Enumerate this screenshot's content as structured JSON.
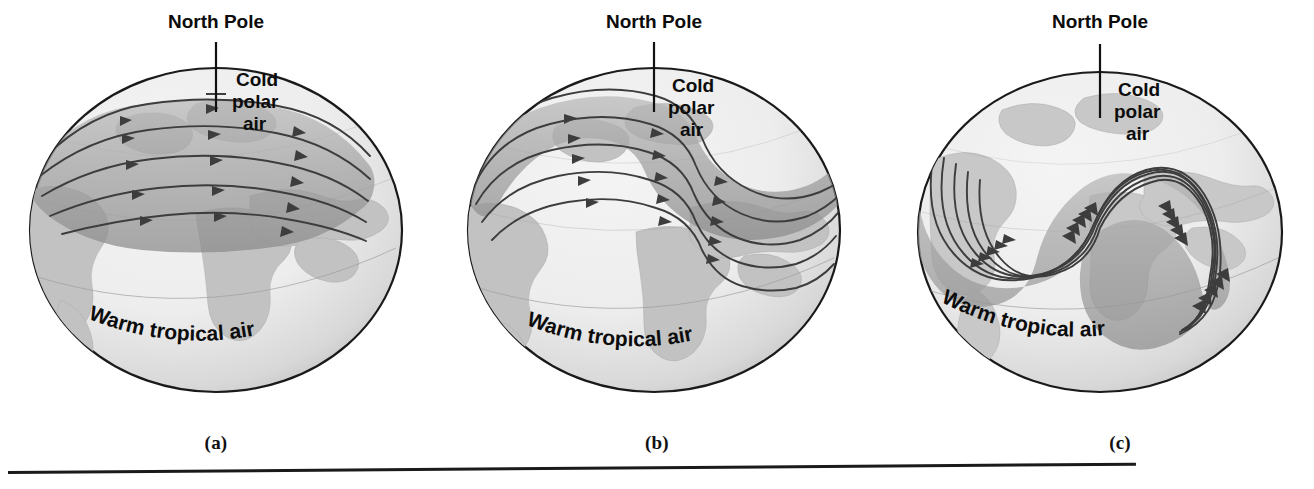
{
  "figure": {
    "panel_count": 3,
    "background_color": "#ffffff",
    "ink_color": "#111111",
    "globe_fill": "#ececec",
    "continent_fill": "#bdbdbd",
    "jet_band_fill": "#9a9a9a",
    "jet_line_color": "#3a3a3a"
  },
  "labels": {
    "north_pole": "North Pole",
    "cold_line1": "Cold",
    "cold_line2": "polar",
    "cold_line3": "air",
    "warm": "Warm tropical air"
  },
  "panels": [
    {
      "id": "a",
      "letter": "(a)",
      "stage_description": "Jet stream flows nearly west to east in a smooth ring around the pole",
      "wave_amplitude": "none",
      "flow_line_count": 5,
      "labels": {
        "north_pole": "North Pole",
        "cold_line1": "Cold",
        "cold_line2": "polar",
        "cold_line3": "air",
        "warm": "Warm tropical air"
      }
    },
    {
      "id": "b",
      "letter": "(b)",
      "stage_description": "A single large meander develops in the jet stream",
      "wave_amplitude": "moderate",
      "flow_line_count": 5,
      "labels": {
        "north_pole": "North Pole",
        "cold_line1": "Cold",
        "cold_line2": "polar",
        "cold_line3": "air",
        "warm": "Warm tropical air"
      }
    },
    {
      "id": "c",
      "letter": "(c)",
      "stage_description": "Waves become fully developed with deep troughs and sharp ridges",
      "wave_amplitude": "large",
      "flow_line_count": 5,
      "labels": {
        "north_pole": "North Pole",
        "cold_line1": "Cold",
        "cold_line2": "polar",
        "cold_line3": "air",
        "warm": "Warm tropical air"
      }
    }
  ],
  "footer": {
    "rule_visible": true
  }
}
